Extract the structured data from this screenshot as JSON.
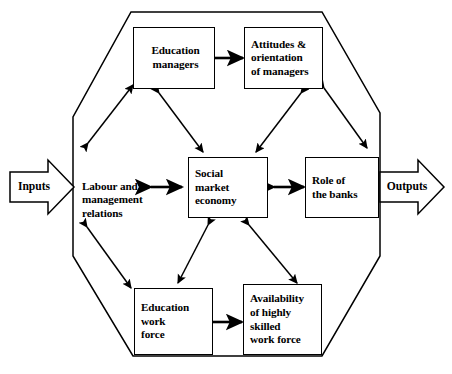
{
  "diagram": {
    "boundary_shape": "octagon",
    "stroke_color": "#000000",
    "fill_color": "#ffffff"
  },
  "io": {
    "input": {
      "label": "Inputs",
      "direction": "right"
    },
    "output": {
      "label": "Outputs",
      "direction": "right"
    }
  },
  "nodes": [
    {
      "id": "education-managers",
      "label": "Education\nmanagers",
      "boxed": true,
      "align": "center"
    },
    {
      "id": "attitudes-orientation-of-managers",
      "label": "Attitudes &\norientation\nof managers",
      "boxed": true,
      "align": "left"
    },
    {
      "id": "labour-and-management-relations",
      "label": "Labour and\nmanagement\nrelations",
      "boxed": false,
      "align": "left"
    },
    {
      "id": "social-market-economy",
      "label": "Social\nmarket\neconomy",
      "boxed": true,
      "align": "left"
    },
    {
      "id": "role-of-the-banks",
      "label": "Role of\nthe banks",
      "boxed": true,
      "align": "left"
    },
    {
      "id": "education-work-force",
      "label": "Education\nwork\nforce",
      "boxed": true,
      "align": "left"
    },
    {
      "id": "availability-of-highly-skilled-work-force",
      "label": "Availability\nof highly\nskilled\nwork force",
      "boxed": true,
      "align": "left"
    }
  ],
  "connections": [
    {
      "from": "education-managers",
      "to": "attitudes-orientation-of-managers",
      "style": "double-arrow"
    },
    {
      "from": "labour-and-management-relations",
      "to": "education-managers",
      "style": "double-arrow"
    },
    {
      "from": "education-managers",
      "to": "social-market-economy",
      "style": "double-arrow"
    },
    {
      "from": "attitudes-orientation-of-managers",
      "to": "social-market-economy",
      "style": "double-arrow"
    },
    {
      "from": "attitudes-orientation-of-managers",
      "to": "role-of-the-banks",
      "style": "double-arrow"
    },
    {
      "from": "labour-and-management-relations",
      "to": "social-market-economy",
      "style": "double-arrow"
    },
    {
      "from": "social-market-economy",
      "to": "role-of-the-banks",
      "style": "double-arrow"
    },
    {
      "from": "labour-and-management-relations",
      "to": "education-work-force",
      "style": "double-arrow"
    },
    {
      "from": "social-market-economy",
      "to": "education-work-force",
      "style": "double-arrow"
    },
    {
      "from": "social-market-economy",
      "to": "availability-of-highly-skilled-work-force",
      "style": "double-arrow"
    },
    {
      "from": "education-work-force",
      "to": "availability-of-highly-skilled-work-force",
      "style": "double-arrow"
    }
  ]
}
